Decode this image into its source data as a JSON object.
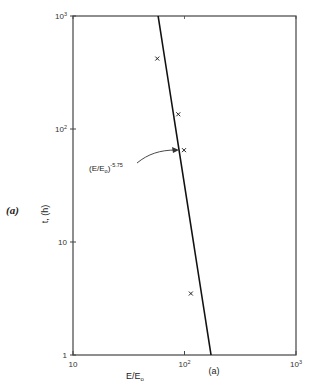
{
  "chart_data": {
    "type": "scatter",
    "title": "",
    "panel_label": "(a)",
    "subplot_caption": "(a)",
    "xlabel": "E/E₀",
    "xlabel_main": "E/E",
    "xlabel_sub": "o",
    "ylabel": "t, (h)",
    "xscale": "log",
    "yscale": "log",
    "xlim": [
      10,
      1000
    ],
    "ylim": [
      1,
      1000
    ],
    "grid": false,
    "x_ticks": [
      {
        "value": 10,
        "label": "10",
        "base": "10",
        "exp": ""
      },
      {
        "value": 100,
        "label": "10^2",
        "base": "10",
        "exp": "2"
      },
      {
        "value": 1000,
        "label": "10^3",
        "base": "10",
        "exp": "3"
      }
    ],
    "y_ticks": [
      {
        "value": 1,
        "label": "1",
        "base": "1",
        "exp": ""
      },
      {
        "value": 10,
        "label": "10",
        "base": "10",
        "exp": ""
      },
      {
        "value": 100,
        "label": "10^2",
        "base": "10",
        "exp": "2"
      },
      {
        "value": 1000,
        "label": "10^3",
        "base": "10",
        "exp": "3"
      }
    ],
    "series": [
      {
        "name": "measured",
        "marker": "x",
        "x": [
          57,
          88,
          99,
          114
        ],
        "y": [
          420,
          135,
          65,
          3.5
        ]
      },
      {
        "name": "fit (E/E0)^-5.75",
        "type": "line",
        "x": [
          58,
          173
        ],
        "y": [
          1000,
          1
        ]
      }
    ],
    "annotation": {
      "text_main": "(E/E",
      "text_sub": "o",
      "text_close": ")",
      "text_exp": "-5.75",
      "full": "(E/E₀)^-5.75",
      "points_to": {
        "x": 97,
        "y": 65
      }
    }
  }
}
